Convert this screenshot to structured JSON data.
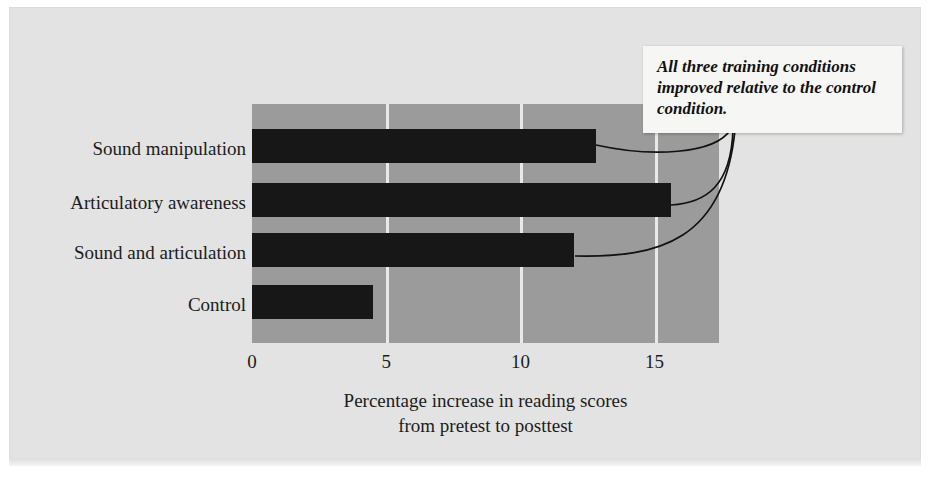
{
  "chart_data": {
    "type": "bar",
    "orientation": "horizontal",
    "title": "",
    "categories": [
      "Sound manipulation",
      "Articulatory awareness",
      "Sound and articulation",
      "Control"
    ],
    "values": [
      12.8,
      15.6,
      12.0,
      4.5
    ],
    "xlabel": "Percentage increase in reading scores from pretest to posttest",
    "ylabel": "",
    "xlim": [
      0,
      17.4
    ],
    "xticks": [
      0,
      5,
      10,
      15
    ],
    "xtick_labels": [
      "0",
      "5",
      "10",
      "15"
    ],
    "gridlines": [
      5,
      10,
      15
    ],
    "grid": true,
    "legend": "none",
    "annotations": [
      {
        "text": "All three training conditions improved relative to the control condition.",
        "points_to": [
          "Sound manipulation",
          "Articulatory awareness",
          "Sound and articulation"
        ]
      }
    ]
  },
  "axis": {
    "title_line_1": "Percentage increase in reading scores",
    "title_line_2": "from pretest to posttest",
    "tick_0": "0",
    "tick_1": "5",
    "tick_2": "10",
    "tick_3": "15"
  },
  "categories": {
    "c0": "Sound manipulation",
    "c1": "Articulatory awareness",
    "c2": "Sound and articulation",
    "c3": "Control"
  },
  "callout": {
    "text": "All three training conditions improved relative to the control condition."
  },
  "colors": {
    "page_background": "#e3e3e3",
    "plot_background": "#9b9b9b",
    "bar": "#171717",
    "gridline": "#e9e9e9",
    "text": "#1c1c1c",
    "callout_background": "#f6f6f4",
    "leader_line": "#111111"
  }
}
